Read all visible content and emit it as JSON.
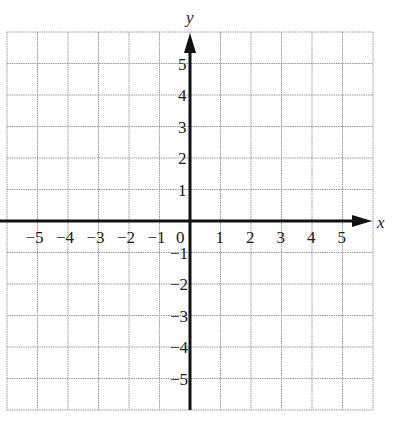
{
  "diagram": {
    "type": "coordinate-grid",
    "axes": {
      "x": {
        "label": "x",
        "min": -6,
        "max": 6,
        "ticks": [
          "-5",
          "-4",
          "-3",
          "-2",
          "-1",
          "0",
          "1",
          "2",
          "3",
          "4",
          "5"
        ]
      },
      "y": {
        "label": "y",
        "min": -6,
        "max": 6,
        "ticks": [
          "5",
          "4",
          "3",
          "2",
          "1",
          "-1",
          "-2",
          "-3",
          "-4",
          "-5"
        ]
      }
    },
    "origin_label": "0",
    "grid": {
      "columns": 12,
      "rows": 12,
      "line_color": "#9a9a9a",
      "axis_color": "#111111"
    }
  }
}
